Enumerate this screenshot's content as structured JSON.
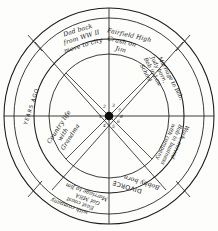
{
  "diagram": {
    "type": "radial-wheel",
    "rings": [
      "outer-annulus",
      "middle-band",
      "inner-circle"
    ],
    "sector_count": 8,
    "hub_color": "#0d0d0d",
    "ink_color": "#1a1a1a",
    "paper_color": "#fdfdfb"
  },
  "outer_ring": {
    "labels": [
      {
        "id": "years-ago",
        "text": "YEARS AGO"
      }
    ]
  },
  "segments": [
    {
      "id": "seg-1",
      "index": 1,
      "position": "upper-left",
      "lines": [
        "Country life",
        "with",
        "Grandma"
      ]
    },
    {
      "id": "seg-2",
      "index": 2,
      "position": "top-left",
      "lines": [
        "Dad back",
        "from WW II",
        "move to city"
      ]
    },
    {
      "id": "seg-3",
      "index": 3,
      "position": "top-right",
      "lines": [
        "Fairfield High",
        "Crush on",
        "Jim"
      ]
    },
    {
      "id": "seg-4",
      "index": 4,
      "position": "upper-right",
      "lines": [
        "Marriage to Bob,",
        "Judy born,",
        "Bob in Law",
        "School"
      ]
    },
    {
      "id": "seg-5",
      "index": 5,
      "position": "lower-right",
      "lines": [
        "Work, moved",
        "Bob in business",
        "with company"
      ]
    },
    {
      "id": "seg-6",
      "index": 6,
      "position": "bottom-right",
      "lines": [
        "Bobby born",
        "DIVORCE"
      ]
    },
    {
      "id": "seg-7",
      "index": 7,
      "position": "bottom-left",
      "lines": [
        "Marriage to Jim",
        "Got MBA",
        "East coast",
        "with company"
      ]
    },
    {
      "id": "seg-8",
      "index": 8,
      "position": "lower-left",
      "lines": []
    }
  ],
  "hub": {
    "spoke_numbers": [
      "1",
      "2",
      "3",
      "4",
      "5",
      "6",
      "7",
      "8"
    ]
  }
}
